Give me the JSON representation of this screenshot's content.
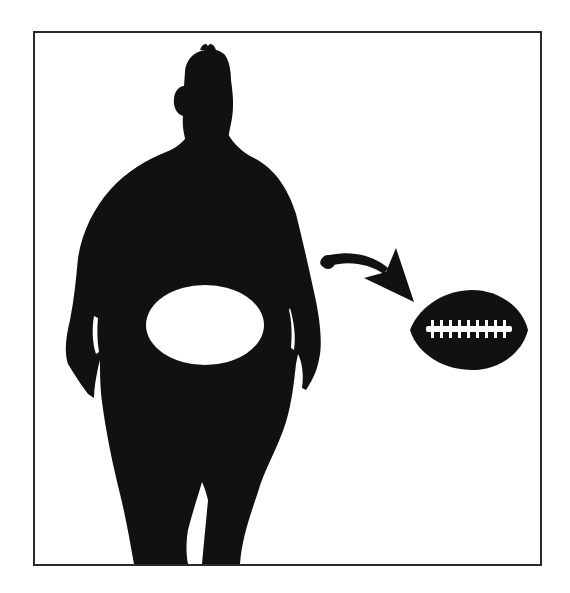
{
  "illustration": {
    "description": "Silhouette of an overweight person with a white oval cut-out at the belly, a curved arrow pointing to an American football",
    "colors": {
      "silhouette": "#111111",
      "background": "#ffffff",
      "frame_border": "#2a2a2a",
      "laces": "#ffffff"
    },
    "elements": {
      "person": "person-silhouette",
      "belly_cutout": "belly-oval-cutout",
      "arrow": "curved-arrow",
      "football": "american-football",
      "laces": {
        "stitch_count": 9
      }
    }
  }
}
